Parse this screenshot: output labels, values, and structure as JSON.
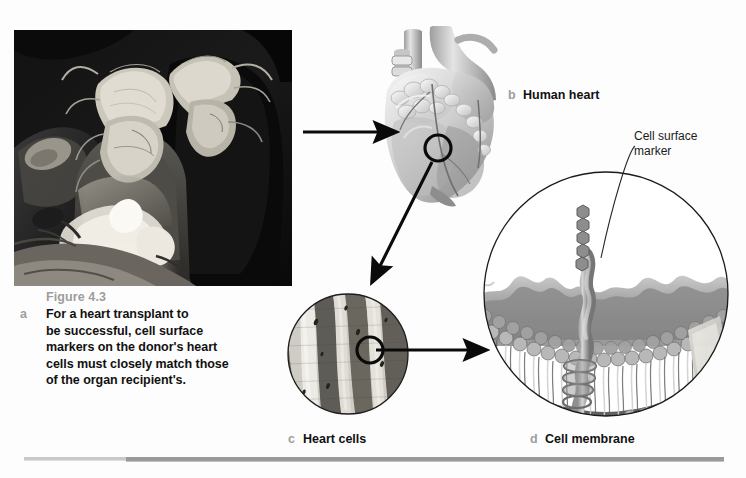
{
  "document": {
    "background_color": "#fdfdfd",
    "figure_number": "Figure 4.3",
    "accent_label_color": "#9d9d9d",
    "text_color": "#111111"
  },
  "caption": {
    "letter": "a",
    "figure_number": "Figure 4.3",
    "line1": "For a heart transplant to",
    "line2": "be successful, cell surface",
    "line3": "markers on the donor's heart",
    "line4": "cells must closely match those",
    "line5": "of the organ recipient's."
  },
  "panels": [
    {
      "letter": "a",
      "label": "Surgical heart transplant photograph",
      "kind": "photograph",
      "description": "Black and white photo of two masked surgeons in gowns leaning over an operating table"
    },
    {
      "letter": "b",
      "label": "Human heart",
      "kind": "illustration",
      "description": "Grayscale anatomical drawing of a human heart with great vessels"
    },
    {
      "letter": "c",
      "label": "Heart cells",
      "kind": "micrograph",
      "description": "Circular light micrograph of striated cardiac muscle fibers"
    },
    {
      "letter": "d",
      "label": "Cell membrane",
      "kind": "illustration",
      "description": "Circular cut-away drawing of a phospholipid bilayer with an embedded glycoprotein"
    }
  ],
  "callouts": [
    {
      "id": "cell-surface-marker",
      "line1": "Cell surface",
      "line2": "marker"
    }
  ],
  "arrows": [
    {
      "id": "photo-to-heart",
      "from": "panel-a",
      "to": "panel-b",
      "direction": "right"
    },
    {
      "id": "heart-to-cells",
      "from": "panel-b",
      "to": "panel-c",
      "direction": "down-left"
    },
    {
      "id": "cells-to-membrane",
      "from": "panel-c",
      "to": "panel-d",
      "direction": "right"
    }
  ],
  "rule": {
    "left_segment_color": "#c9c9c9",
    "right_segment_color": "#9a9a9a"
  }
}
